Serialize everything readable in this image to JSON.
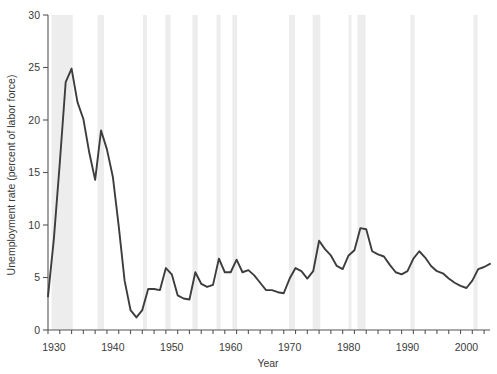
{
  "chart_data": {
    "type": "line",
    "title": "",
    "xlabel": "Year",
    "ylabel": "Unemployment rate (percent of labor force)",
    "xlim": [
      1929,
      2004
    ],
    "ylim": [
      0,
      30
    ],
    "yticks": [
      0,
      5,
      10,
      15,
      20,
      25,
      30
    ],
    "ytick_labels": [
      "0",
      "5",
      "10",
      "15",
      "20",
      "25",
      "30"
    ],
    "xticks": [
      1930,
      1940,
      1950,
      1960,
      1970,
      1980,
      1990,
      2000
    ],
    "xtick_labels": [
      "1930",
      "1940",
      "1950",
      "1960",
      "1970",
      "1980",
      "1990",
      "2000"
    ],
    "x_minor_tick_interval": 2,
    "grid": false,
    "legend": null,
    "series_name": "Unemployment rate",
    "line_color": "#3d3d3d",
    "line_width": 1.9,
    "x": [
      1929,
      1930,
      1931,
      1932,
      1933,
      1934,
      1935,
      1936,
      1937,
      1938,
      1939,
      1940,
      1941,
      1942,
      1943,
      1944,
      1945,
      1946,
      1947,
      1948,
      1949,
      1950,
      1951,
      1952,
      1953,
      1954,
      1955,
      1956,
      1957,
      1958,
      1959,
      1960,
      1961,
      1962,
      1963,
      1964,
      1965,
      1966,
      1967,
      1968,
      1969,
      1970,
      1971,
      1972,
      1973,
      1974,
      1975,
      1976,
      1977,
      1978,
      1979,
      1980,
      1981,
      1982,
      1983,
      1984,
      1985,
      1986,
      1987,
      1988,
      1989,
      1990,
      1991,
      1992,
      1993,
      1994,
      1995,
      1996,
      1997,
      1998,
      1999,
      2000,
      2001,
      2002,
      2003,
      2004
    ],
    "values": [
      3.2,
      8.7,
      15.9,
      23.6,
      24.9,
      21.7,
      20.1,
      16.9,
      14.3,
      19.0,
      17.2,
      14.6,
      9.9,
      4.7,
      1.9,
      1.2,
      1.9,
      3.9,
      3.9,
      3.8,
      5.9,
      5.3,
      3.3,
      3.0,
      2.9,
      5.5,
      4.4,
      4.1,
      4.3,
      6.8,
      5.5,
      5.5,
      6.7,
      5.5,
      5.7,
      5.2,
      4.5,
      3.8,
      3.8,
      3.6,
      3.5,
      4.9,
      5.9,
      5.6,
      4.9,
      5.6,
      8.5,
      7.7,
      7.1,
      6.1,
      5.8,
      7.1,
      7.6,
      9.7,
      9.6,
      7.5,
      7.2,
      7.0,
      6.2,
      5.5,
      5.3,
      5.6,
      6.8,
      7.5,
      6.9,
      6.1,
      5.6,
      5.4,
      4.9,
      4.5,
      4.2,
      4.0,
      4.7,
      5.8,
      6.0,
      6.3
    ],
    "recession_bands": [
      {
        "start": 1929.6,
        "end": 1933.2
      },
      {
        "start": 1937.4,
        "end": 1938.5
      },
      {
        "start": 1945.1,
        "end": 1945.8
      },
      {
        "start": 1948.9,
        "end": 1949.8
      },
      {
        "start": 1953.5,
        "end": 1954.4
      },
      {
        "start": 1957.6,
        "end": 1958.3
      },
      {
        "start": 1960.3,
        "end": 1961.1
      },
      {
        "start": 1969.9,
        "end": 1970.9
      },
      {
        "start": 1973.9,
        "end": 1975.2
      },
      {
        "start": 1980.0,
        "end": 1980.5
      },
      {
        "start": 1981.5,
        "end": 1982.9
      },
      {
        "start": 1990.5,
        "end": 1991.2
      },
      {
        "start": 2001.2,
        "end": 2001.9
      }
    ],
    "band_color": "#ededed"
  }
}
